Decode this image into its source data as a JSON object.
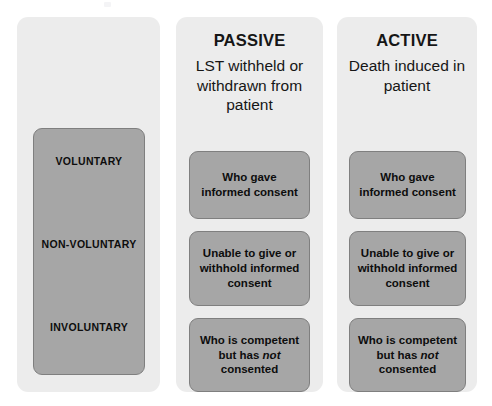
{
  "diagram": {
    "title_present": false,
    "columns": [
      {
        "id": "tiers",
        "heading": "",
        "subheading": "",
        "tiers": [
          {
            "label": "VOLUNTARY"
          },
          {
            "label": "NON-VOLUNTARY"
          },
          {
            "label": "INVOLUNTARY"
          }
        ]
      },
      {
        "id": "passive",
        "heading": "PASSIVE",
        "subheading": "LST withheld or withdrawn from patient",
        "boxes": [
          {
            "text": "Who gave informed consent",
            "emphasis": ""
          },
          {
            "text": "Unable to give or withhold informed consent",
            "emphasis": ""
          },
          {
            "text_before": "Who is competent but has ",
            "emphasis": "not",
            "text_after": " consented"
          }
        ]
      },
      {
        "id": "active",
        "heading": "ACTIVE",
        "subheading": "Death induced in patient",
        "boxes": [
          {
            "text": "Who gave informed consent",
            "emphasis": ""
          },
          {
            "text": "Unable to give or withhold informed consent",
            "emphasis": ""
          },
          {
            "text_before": "Who is competent but has ",
            "emphasis": "not",
            "text_after": " consented"
          }
        ]
      }
    ],
    "colors": {
      "panel_background": "#ececec",
      "box_fill": "#a6a6a6",
      "box_border": "#7f7f7f",
      "text": "#0d0d0d",
      "page_background": "#ffffff"
    }
  }
}
